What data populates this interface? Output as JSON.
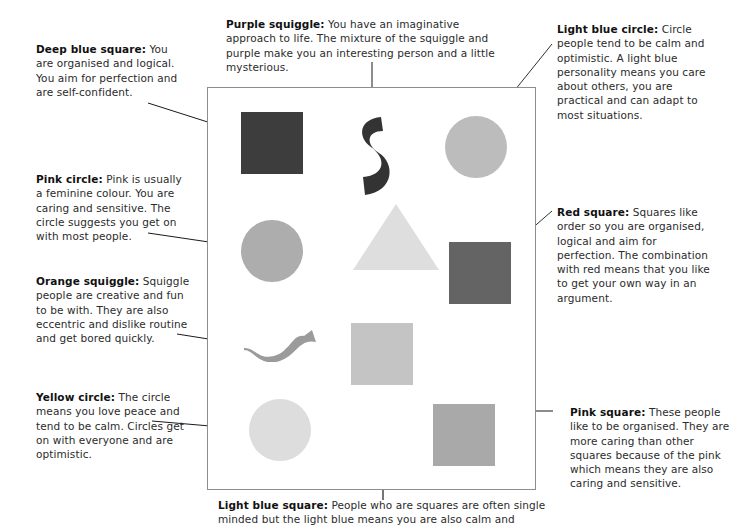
{
  "diagram": {
    "frame": {
      "x": 207,
      "y": 87,
      "width": 329,
      "height": 403,
      "border_color": "#8d8d8d"
    },
    "shapes": [
      {
        "id": "deep-blue-square",
        "name": "Deep blue square",
        "type": "square",
        "color": "#3d3d3d",
        "x": 240,
        "y": 111,
        "width": 62,
        "height": 62
      },
      {
        "id": "purple-squiggle",
        "name": "Purple squiggle",
        "type": "squiggle",
        "color": "#333333",
        "x": 356,
        "y": 112,
        "width": 34,
        "height": 80,
        "orientation": "vertical"
      },
      {
        "id": "light-blue-circle",
        "name": "Light blue circle",
        "type": "circle",
        "color": "#bcbcbc",
        "x": 444,
        "y": 115,
        "width": 62,
        "height": 62
      },
      {
        "id": "pink-circle",
        "name": "Pink circle",
        "type": "circle",
        "color": "#adadad",
        "x": 240,
        "y": 219,
        "width": 62,
        "height": 62
      },
      {
        "id": "light-grey-triangle",
        "name": "Triangle",
        "type": "triangle",
        "color": "#dedede",
        "x": 352,
        "y": 203,
        "width": 86,
        "height": 66
      },
      {
        "id": "red-square",
        "name": "Red square",
        "type": "square",
        "color": "#646464",
        "x": 448,
        "y": 241,
        "width": 62,
        "height": 62
      },
      {
        "id": "orange-squiggle",
        "name": "Orange squiggle",
        "type": "squiggle",
        "color": "#9b9b9b",
        "x": 243,
        "y": 327,
        "width": 70,
        "height": 32,
        "orientation": "horizontal"
      },
      {
        "id": "light-blue-square",
        "name": "Light blue square",
        "type": "square",
        "color": "#c4c4c4",
        "x": 356,
        "y": 322,
        "width": 62,
        "height": 62
      },
      {
        "id": "yellow-circle",
        "name": "Yellow circle",
        "type": "circle",
        "color": "#dddddd",
        "x": 248,
        "y": 398,
        "width": 62,
        "height": 62
      },
      {
        "id": "pink-square",
        "name": "Pink square",
        "type": "square",
        "color": "#a9a9a9",
        "x": 432,
        "y": 403,
        "width": 62,
        "height": 62
      }
    ],
    "annotations": [
      {
        "id": "deep-blue-square-note",
        "label": "Deep blue square:",
        "text": " You are organised and logical. You aim for perfection and are self-confident.",
        "position": "left-top"
      },
      {
        "id": "pink-circle-note",
        "label": "Pink circle:",
        "text": " Pink is usually a feminine colour. You are caring and sensitive. The circle suggests you get on with most people.",
        "position": "left-upper-mid"
      },
      {
        "id": "orange-squiggle-note",
        "label": "Orange squiggle:",
        "text": " Squiggle people are creative and fun to be with. They are also eccentric and dislike routine and get bored quickly.",
        "position": "left-lower-mid"
      },
      {
        "id": "yellow-circle-note",
        "label": "Yellow circle:",
        "text": " The circle means you love peace and tend to be calm. Circles get on with everyone and are optimistic.",
        "position": "left-bottom"
      },
      {
        "id": "purple-squiggle-note",
        "label": "Purple squiggle:",
        "text": " You have an imaginative approach to life. The mixture of the squiggle and purple make you an interesting person and a little mysterious.",
        "position": "top-centre"
      },
      {
        "id": "light-blue-circle-note",
        "label": "Light blue circle:",
        "text": " Circle people tend to be calm and optimistic. A light blue personality means you care about others, you are practical and can adapt to most situations.",
        "position": "right-top"
      },
      {
        "id": "red-square-note",
        "label": "Red square:",
        "text": " Squares like order so you are organised, logical and aim for perfection. The combination with red means that you like to get your own way in an argument.",
        "position": "right-mid"
      },
      {
        "id": "pink-square-note",
        "label": "Pink square:",
        "text": " These people like to be organised. They are more caring than other squares because of the pink which means they are also caring and sensitive.",
        "position": "right-bottom"
      },
      {
        "id": "light-blue-square-note",
        "label": "Light blue square:",
        "text": " People who are squares are often single minded but the light blue means you are also calm and",
        "position": "bottom-centre"
      }
    ],
    "arrows": [
      {
        "id": "arrow-deep-blue-square",
        "from": [
          148,
          103
        ],
        "to": [
          236,
          131
        ]
      },
      {
        "id": "arrow-pink-circle",
        "from": [
          148,
          233
        ],
        "to": [
          236,
          246
        ]
      },
      {
        "id": "arrow-orange-squiggle",
        "from": [
          177,
          334
        ],
        "to": [
          240,
          344
        ]
      },
      {
        "id": "arrow-yellow-circle",
        "from": [
          152,
          421
        ],
        "to": [
          245,
          429
        ]
      },
      {
        "id": "arrow-purple-squiggle",
        "from": [
          372,
          62
        ],
        "to": [
          372,
          112
        ]
      },
      {
        "id": "arrow-light-blue-circle",
        "from": [
          552,
          44
        ],
        "to": [
          490,
          121
        ]
      },
      {
        "id": "arrow-red-square",
        "from": [
          552,
          211
        ],
        "to": [
          506,
          250
        ]
      },
      {
        "id": "arrow-pink-square",
        "from": [
          553,
          411
        ],
        "to": [
          498,
          411
        ]
      },
      {
        "id": "arrow-light-blue-square",
        "from": [
          383,
          500
        ],
        "to": [
          383,
          388
        ]
      }
    ]
  }
}
